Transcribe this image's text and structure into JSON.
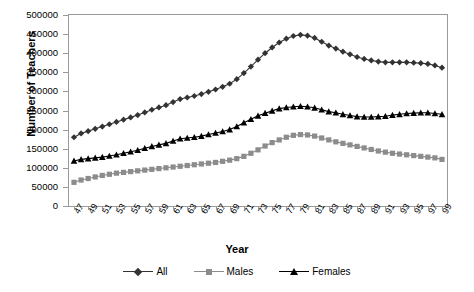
{
  "chart_data": {
    "type": "line",
    "title": "",
    "xlabel": "Year",
    "ylabel": "Number of Teachers",
    "ylim": [
      0,
      500000
    ],
    "ytick_values": [
      0,
      50000,
      100000,
      150000,
      200000,
      250000,
      300000,
      350000,
      400000,
      450000,
      500000
    ],
    "ytick_labels": [
      "0",
      "50000",
      "100000",
      "150000",
      "200000",
      "250000",
      "300000",
      "350000",
      "400000",
      "450000",
      "500000"
    ],
    "grid": false,
    "legend_position": "bottom",
    "x": [
      47,
      48,
      49,
      50,
      51,
      52,
      53,
      54,
      55,
      56,
      57,
      58,
      59,
      60,
      61,
      62,
      63,
      64,
      65,
      66,
      67,
      68,
      69,
      70,
      71,
      72,
      73,
      74,
      75,
      76,
      77,
      78,
      79,
      80,
      81,
      82,
      83,
      84,
      85,
      86,
      87,
      88,
      89,
      90,
      91,
      92,
      93,
      94,
      95,
      96,
      97,
      98,
      99
    ],
    "xtick_labels": [
      "47",
      "",
      "49",
      "",
      "51",
      "",
      "53",
      "",
      "55",
      "",
      "57",
      "",
      "59",
      "",
      "61",
      "",
      "63",
      "",
      "65",
      "",
      "67",
      "",
      "69",
      "",
      "71",
      "",
      "73",
      "",
      "75",
      "",
      "77",
      "",
      "79",
      "",
      "81",
      "",
      "83",
      "",
      "85",
      "",
      "87",
      "",
      "89",
      "",
      "91",
      "",
      "93",
      "",
      "95",
      "",
      "97",
      "",
      "99"
    ],
    "series": [
      {
        "name": "All",
        "marker": "diamond",
        "color": "#333333",
        "values": [
          180000,
          190000,
          196000,
          202000,
          208000,
          214000,
          220000,
          226000,
          232000,
          238000,
          245000,
          252000,
          258000,
          264000,
          272000,
          280000,
          284000,
          288000,
          293000,
          299000,
          305000,
          312000,
          320000,
          332000,
          348000,
          365000,
          383000,
          400000,
          415000,
          428000,
          438000,
          445000,
          448000,
          446000,
          440000,
          430000,
          420000,
          412000,
          404000,
          397000,
          390000,
          385000,
          381000,
          378000,
          376000,
          376000,
          376000,
          376000,
          375000,
          374000,
          372000,
          368000,
          362000
        ]
      },
      {
        "name": "Males",
        "marker": "square",
        "color": "#8c8c8c",
        "values": [
          62000,
          68000,
          72000,
          76000,
          80000,
          83000,
          86000,
          88000,
          90000,
          92000,
          94000,
          96000,
          98000,
          100000,
          102000,
          104000,
          106000,
          108000,
          110000,
          112000,
          114000,
          117000,
          120000,
          124000,
          130000,
          138000,
          147000,
          157000,
          166000,
          173000,
          180000,
          185000,
          187000,
          186000,
          183000,
          178000,
          173000,
          168000,
          164000,
          160000,
          156000,
          152000,
          148000,
          144000,
          141000,
          138000,
          136000,
          134000,
          132000,
          130000,
          128000,
          126000,
          122000
        ]
      },
      {
        "name": "Females",
        "marker": "triangle",
        "color": "#000000",
        "values": [
          118000,
          122000,
          124000,
          126000,
          128000,
          131000,
          134000,
          138000,
          142000,
          146000,
          151000,
          156000,
          160000,
          164000,
          170000,
          176000,
          178000,
          180000,
          183000,
          187000,
          191000,
          195000,
          200000,
          208000,
          218000,
          227000,
          236000,
          243000,
          249000,
          255000,
          258000,
          260000,
          261000,
          260000,
          257000,
          252000,
          247000,
          244000,
          240000,
          237000,
          234000,
          233000,
          233000,
          234000,
          235000,
          238000,
          240000,
          242000,
          243000,
          244000,
          244000,
          242000,
          240000
        ]
      }
    ]
  },
  "legend": {
    "entries": [
      {
        "label": "All"
      },
      {
        "label": "Males"
      },
      {
        "label": "Females"
      }
    ]
  }
}
